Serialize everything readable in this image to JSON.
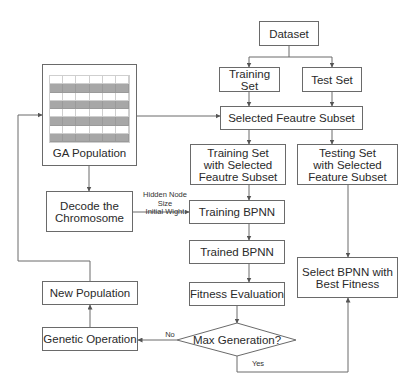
{
  "diagram": {
    "type": "flowchart",
    "nodes": {
      "dataset": "Dataset",
      "training_set": "Training Set",
      "test_set": "Test Set",
      "selected_subset": "Selected Feautre Subset",
      "training_selected": "Training Set with Selected Feautre Subset",
      "testing_selected": "Testing Set with Selected Feature Subset",
      "ga_population": "GA Population",
      "decode": "Decode the Chromosome",
      "training_bpnn": "Training BPNN",
      "trained_bpnn": "Trained BPNN",
      "fitness_eval": "Fitness Evaluation",
      "max_generation": "Max Generation?",
      "genetic_operation": "Genetic Operation",
      "new_population": "New Population",
      "select_best": "Select BPNN with Best Fitness"
    },
    "lines": {
      "training_selected": [
        "Training Set",
        "with Selected",
        "Feautre Subset"
      ],
      "testing_selected": [
        "Testing Set",
        "with Selected",
        "Feature Subset"
      ],
      "decode": [
        "Decode the",
        "Chromosome"
      ],
      "select_best": [
        "Select BPNN with",
        "Best Fitness"
      ]
    },
    "edge_labels": {
      "hidden_node": "Hidden Node",
      "size": "Size",
      "initial_weight": "Initial Wight",
      "no": "No",
      "yes": "Yes"
    },
    "edges": [
      {
        "from": "Dataset",
        "to": "Training Set"
      },
      {
        "from": "Dataset",
        "to": "Test Set"
      },
      {
        "from": "Training Set",
        "to": "Selected Feautre Subset"
      },
      {
        "from": "Test Set",
        "to": "Selected Feautre Subset"
      },
      {
        "from": "GA Population",
        "to": "Selected Feautre Subset"
      },
      {
        "from": "Selected Feautre Subset",
        "to": "Training Set with Selected Feautre Subset"
      },
      {
        "from": "Selected Feautre Subset",
        "to": "Testing Set with Selected Feature Subset"
      },
      {
        "from": "GA Population",
        "to": "Decode the Chromosome"
      },
      {
        "from": "Decode the Chromosome",
        "to": "Training BPNN",
        "label": "Hidden Node Size / Initial Wight"
      },
      {
        "from": "Training Set with Selected Feautre Subset",
        "to": "Training BPNN"
      },
      {
        "from": "Training BPNN",
        "to": "Trained BPNN"
      },
      {
        "from": "Trained BPNN",
        "to": "Fitness Evaluation"
      },
      {
        "from": "Fitness Evaluation",
        "to": "Max Generation?"
      },
      {
        "from": "Max Generation?",
        "to": "Genetic Operation",
        "label": "No"
      },
      {
        "from": "Max Generation?",
        "to": "Select BPNN with Best Fitness",
        "label": "Yes"
      },
      {
        "from": "Testing Set with Selected Feature Subset",
        "to": "Select BPNN with Best Fitness"
      },
      {
        "from": "Genetic Operation",
        "to": "New Population"
      },
      {
        "from": "New Population",
        "to": "GA Population"
      }
    ],
    "population_grid": {
      "rows": 8,
      "cols": 6,
      "shaded_rows": [
        1,
        3,
        5,
        7
      ]
    },
    "colors": {
      "line": "#6a6a6a",
      "shade": "#a7a7a7",
      "background": "#ffffff"
    }
  }
}
